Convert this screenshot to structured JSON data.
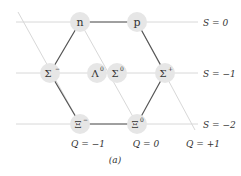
{
  "diagram": {
    "caption": "(a)",
    "colors": {
      "hex_edge": "#555555",
      "guide_line": "#d8d8d8",
      "node_fill": "#e6e6e6",
      "text": "#333333"
    },
    "strangeness_labels": [
      {
        "label": "S = 0",
        "y": 22
      },
      {
        "label": "S = −1",
        "y": 73
      },
      {
        "label": "S = −2",
        "y": 124
      }
    ],
    "charge_labels": [
      {
        "label": "Q = −1",
        "x": 85
      },
      {
        "label": "Q = 0",
        "x": 146
      },
      {
        "label": "Q = +1",
        "x": 203
      }
    ],
    "particles": [
      {
        "id": "n",
        "base": "n",
        "sup": "",
        "x": 80,
        "y": 22
      },
      {
        "id": "p",
        "base": "p",
        "sup": "",
        "x": 137,
        "y": 22
      },
      {
        "id": "sigma-minus",
        "base": "Σ",
        "sup": "−",
        "x": 50,
        "y": 73
      },
      {
        "id": "lambda-0",
        "base": "Λ",
        "sup": "0",
        "x": 97,
        "y": 73
      },
      {
        "id": "sigma-0",
        "base": "Σ",
        "sup": "0",
        "x": 117,
        "y": 73
      },
      {
        "id": "sigma-plus",
        "base": "Σ",
        "sup": "+",
        "x": 165,
        "y": 73
      },
      {
        "id": "xi-minus",
        "base": "Ξ",
        "sup": "−",
        "x": 80,
        "y": 124
      },
      {
        "id": "xi-0",
        "base": "Ξ",
        "sup": "0",
        "x": 137,
        "y": 124
      }
    ]
  }
}
